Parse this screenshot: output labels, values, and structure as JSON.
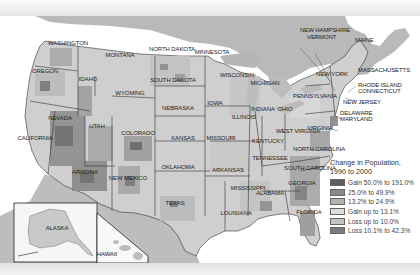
{
  "map": {
    "title": "Change in Population, 1990 to 2000",
    "states": [
      {
        "name": "WASHINGTON",
        "x": 68,
        "y": 43
      },
      {
        "name": "OREGON",
        "x": 45,
        "y": 71
      },
      {
        "name": "IDAHO",
        "x": 88,
        "y": 79
      },
      {
        "name": "MONTANA",
        "x": 120,
        "y": 55
      },
      {
        "name": "WYOMING",
        "x": 130,
        "y": 93
      },
      {
        "name": "NORTH DAKOTA",
        "x": 172,
        "y": 49
      },
      {
        "name": "SOUTH DAKOTA",
        "x": 173,
        "y": 80
      },
      {
        "name": "MINNESOTA",
        "x": 212,
        "y": 52
      },
      {
        "name": "WISCONSIN",
        "x": 237,
        "y": 75
      },
      {
        "name": "MICHIGAN",
        "x": 265,
        "y": 83
      },
      {
        "name": "NEBRASKA",
        "x": 178,
        "y": 108
      },
      {
        "name": "IOWA",
        "x": 215,
        "y": 103
      },
      {
        "name": "ILLINOIS",
        "x": 244,
        "y": 117
      },
      {
        "name": "INDIANA",
        "x": 263,
        "y": 109
      },
      {
        "name": "OHIO",
        "x": 285,
        "y": 109
      },
      {
        "name": "PENNSYLVANIA",
        "x": 315,
        "y": 96
      },
      {
        "name": "NEW YORK",
        "x": 332,
        "y": 74
      },
      {
        "name": "NEVADA",
        "x": 60,
        "y": 118
      },
      {
        "name": "UTAH",
        "x": 97,
        "y": 126
      },
      {
        "name": "COLORADO",
        "x": 138,
        "y": 133
      },
      {
        "name": "KANSAS",
        "x": 183,
        "y": 138
      },
      {
        "name": "MISSOURI",
        "x": 221,
        "y": 138
      },
      {
        "name": "KENTUCKY",
        "x": 268,
        "y": 141
      },
      {
        "name": "WEST VIRGINIA",
        "x": 298,
        "y": 131
      },
      {
        "name": "VIRGINIA",
        "x": 320,
        "y": 128
      },
      {
        "name": "CALIFORNIA",
        "x": 35,
        "y": 138
      },
      {
        "name": "ARIZONA",
        "x": 85,
        "y": 172
      },
      {
        "name": "NEW MEXICO",
        "x": 128,
        "y": 178
      },
      {
        "name": "OKLAHOMA",
        "x": 178,
        "y": 167
      },
      {
        "name": "ARKANSAS",
        "x": 228,
        "y": 170
      },
      {
        "name": "TENNESSEE",
        "x": 270,
        "y": 158
      },
      {
        "name": "NORTH CAROLINA",
        "x": 319,
        "y": 149
      },
      {
        "name": "SOUTH CAROLINA",
        "x": 310,
        "y": 168
      },
      {
        "name": "GEORGIA",
        "x": 302,
        "y": 183
      },
      {
        "name": "ALABAMA",
        "x": 270,
        "y": 193
      },
      {
        "name": "MISSISSIPPI",
        "x": 248,
        "y": 188
      },
      {
        "name": "LOUISIANA",
        "x": 236,
        "y": 213
      },
      {
        "name": "TEXAS",
        "x": 175,
        "y": 203
      },
      {
        "name": "FLORIDA",
        "x": 309,
        "y": 212
      },
      {
        "name": "ALASKA",
        "x": 57,
        "y": 228
      },
      {
        "name": "HAWAII",
        "x": 107,
        "y": 254
      }
    ],
    "callouts": [
      {
        "name": "NEW HAMPSHIRE",
        "x": 300,
        "y": 30
      },
      {
        "name": "VERMONT",
        "x": 307,
        "y": 37
      },
      {
        "name": "MAINE",
        "x": 355,
        "y": 40
      },
      {
        "name": "MASSACHUSETTS",
        "x": 358,
        "y": 70
      },
      {
        "name": "RHODE ISLAND",
        "x": 358,
        "y": 85
      },
      {
        "name": "CONNECTICUT",
        "x": 358,
        "y": 91
      },
      {
        "name": "NEW JERSEY",
        "x": 343,
        "y": 102
      },
      {
        "name": "DELAWARE",
        "x": 340,
        "y": 113
      },
      {
        "name": "MARYLAND",
        "x": 340,
        "y": 119
      }
    ]
  },
  "legend": {
    "title_line1": "Change in Population,",
    "title_line2": "1990 to 2000",
    "items": [
      {
        "label": "Gain 50.0% to 191.0%",
        "color": "#5e5e5e"
      },
      {
        "label": "25.0% to 49.9%",
        "color": "#8a8a8a"
      },
      {
        "label": "13.2% to 24.9%",
        "color": "#b2b2b2"
      },
      {
        "label": "Gain up to 13.1%",
        "color": "#dedede"
      },
      {
        "label": "Loss up to 10.0%",
        "color": "#c4c4c4"
      },
      {
        "label": "Loss 10.1% to 42.3%",
        "color": "#7a7a7a"
      }
    ]
  }
}
